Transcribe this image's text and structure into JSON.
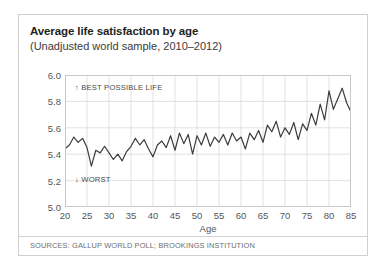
{
  "card": {
    "title": "Average life satisfaction by age",
    "subtitle": "(Unadjusted world sample, 2010–2012)",
    "sources": "SOURCES: GALLUP WORLD POLL; BROOKINGS INSTITUTION"
  },
  "colors": {
    "line": "#3c3c3c",
    "grid": "#d5d5d5",
    "frame": "#c8c8c8",
    "border": "#cfcfcf",
    "title_text": "#231f20",
    "axis_text": "#555555",
    "source_text": "#6e6e6e"
  },
  "annotations": {
    "best": "BEST POSSIBLE LIFE",
    "best_arrow": "↑",
    "worst": "WORST",
    "worst_arrow": "↓"
  },
  "chart_data": {
    "type": "line",
    "title": "Average life satisfaction by age",
    "subtitle": "(Unadjusted world sample, 2010–2012)",
    "xlabel": "Age",
    "ylabel": "",
    "xlim": [
      20,
      85
    ],
    "ylim": [
      5.0,
      6.0
    ],
    "xticks": [
      20,
      25,
      30,
      35,
      40,
      45,
      50,
      55,
      60,
      65,
      70,
      75,
      80,
      85
    ],
    "yticks": [
      "5.0",
      "5.2",
      "5.4",
      "5.6",
      "5.8",
      "6.0"
    ],
    "grid": true,
    "legend": "none",
    "series": [
      {
        "name": "Average life satisfaction",
        "x": [
          20,
          21,
          22,
          23,
          24,
          25,
          26,
          27,
          28,
          29,
          30,
          31,
          32,
          33,
          34,
          35,
          36,
          37,
          38,
          39,
          40,
          41,
          42,
          43,
          44,
          45,
          46,
          47,
          48,
          49,
          50,
          51,
          52,
          53,
          54,
          55,
          56,
          57,
          58,
          59,
          60,
          61,
          62,
          63,
          64,
          65,
          66,
          67,
          68,
          69,
          70,
          71,
          72,
          73,
          74,
          75,
          76,
          77,
          78,
          79,
          80,
          81,
          82,
          83,
          84,
          85
        ],
        "values": [
          5.44,
          5.47,
          5.53,
          5.49,
          5.52,
          5.45,
          5.31,
          5.43,
          5.41,
          5.46,
          5.41,
          5.36,
          5.4,
          5.35,
          5.42,
          5.46,
          5.52,
          5.47,
          5.51,
          5.44,
          5.38,
          5.47,
          5.5,
          5.45,
          5.54,
          5.43,
          5.56,
          5.48,
          5.55,
          5.4,
          5.54,
          5.47,
          5.56,
          5.46,
          5.53,
          5.49,
          5.55,
          5.47,
          5.56,
          5.5,
          5.53,
          5.44,
          5.56,
          5.51,
          5.58,
          5.49,
          5.62,
          5.57,
          5.65,
          5.53,
          5.6,
          5.55,
          5.64,
          5.51,
          5.63,
          5.58,
          5.71,
          5.62,
          5.78,
          5.66,
          5.88,
          5.74,
          5.82,
          5.9,
          5.79,
          5.72
        ]
      }
    ],
    "note": "Age 20-85 noisy annual series; low plateau near ages 25-35, gradual rise through 40s-50s, peak near ages 63-65 at ~5.90, volatile decline afterwards with an upturn at ages 84-85."
  }
}
